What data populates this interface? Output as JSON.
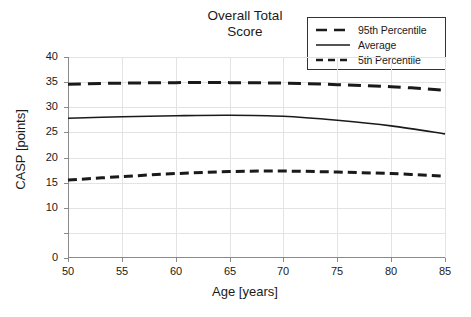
{
  "chart_data": {
    "type": "line",
    "title": "Overall Total\nScore",
    "xlabel": "Age [years]",
    "ylabel": "CASP [points]",
    "xlim": [
      50,
      85
    ],
    "ylim": [
      0,
      40
    ],
    "grid": true,
    "legend_position": "top-right",
    "xticks": [
      "50",
      "55",
      "60",
      "65",
      "70",
      "75",
      "80",
      "85"
    ],
    "xtick_values": [
      50,
      55,
      60,
      65,
      70,
      75,
      80,
      85
    ],
    "yticks": [
      "0",
      "",
      "10",
      "15",
      "20",
      "25",
      "30",
      "35",
      "40"
    ],
    "ytick_values": [
      0,
      5,
      10,
      15,
      20,
      25,
      30,
      35,
      40
    ],
    "x": [
      50,
      55,
      60,
      65,
      70,
      75,
      80,
      85
    ],
    "series": [
      {
        "name": "95th Percentile",
        "style": "long-dashed",
        "color": "#1a1a1a",
        "values": [
          34.6,
          34.8,
          34.9,
          34.9,
          34.8,
          34.5,
          34.1,
          33.4
        ]
      },
      {
        "name": "Average",
        "style": "solid",
        "color": "#1a1a1a",
        "values": [
          27.8,
          28.1,
          28.3,
          28.4,
          28.2,
          27.4,
          26.3,
          24.7
        ]
      },
      {
        "name": "5th Percentile",
        "style": "dashed",
        "color": "#1a1a1a",
        "values": [
          15.5,
          16.2,
          16.8,
          17.2,
          17.3,
          17.1,
          16.8,
          16.3
        ]
      }
    ]
  },
  "legend": {
    "items": [
      {
        "label": "95th Percentile"
      },
      {
        "label": "Average"
      },
      {
        "label": "5th Percentile"
      }
    ]
  },
  "colors": {
    "line": "#1a1a1a",
    "grid": "#e3e3e3",
    "axis": "#8a8a8a",
    "background": "#ffffff"
  }
}
